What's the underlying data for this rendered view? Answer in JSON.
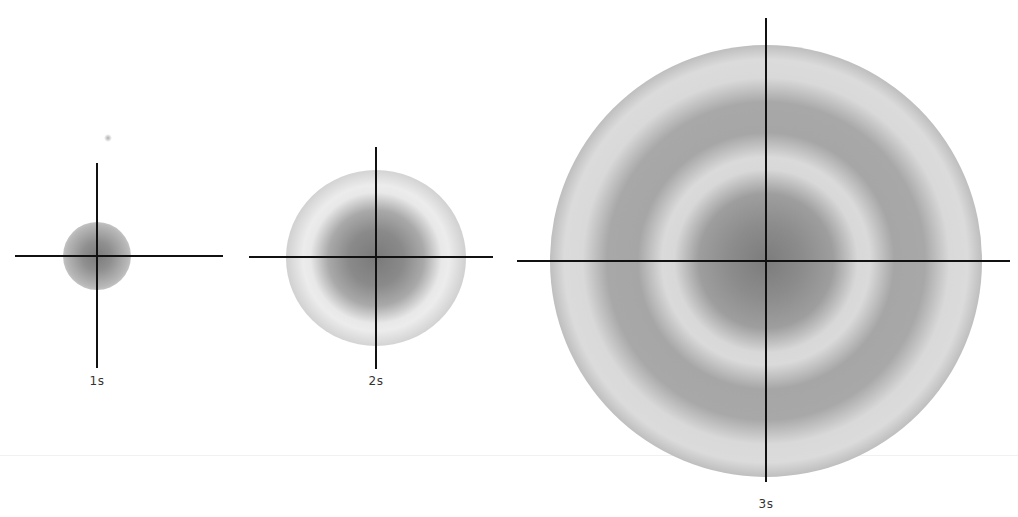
{
  "diagram": {
    "title": "",
    "orbitals": [
      {
        "label": "1s",
        "center": [
          97,
          256
        ],
        "radius": 32,
        "nodes": 0
      },
      {
        "label": "2s",
        "center": [
          376,
          258
        ],
        "radius": 88,
        "nodes": 1
      },
      {
        "label": "3s",
        "center": [
          766,
          261
        ],
        "radius": 218,
        "nodes": 2
      }
    ],
    "colors": {
      "axis": "#111111",
      "density_dark": "#6e6e6e",
      "density_mid": "#9a9a9a",
      "node_light": "#d8d8d8",
      "background": "#ffffff"
    }
  }
}
